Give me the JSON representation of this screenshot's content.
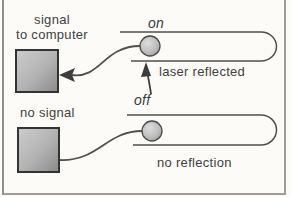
{
  "figure": {
    "top_panel": {
      "output_label_line1": "signal",
      "output_label_line2": "to computer",
      "state_label": "on",
      "annotation": "laser reflected"
    },
    "bottom_panel": {
      "output_label": "no signal",
      "state_label": "off",
      "annotation": "no reflection"
    },
    "colors": {
      "ink": "#4a4a4a",
      "text": "#414141",
      "box_fill_light": "#cccccc",
      "box_fill_dark": "#8a8a8a",
      "ball_fill_light": "#dddddd",
      "ball_fill_dark": "#969696",
      "frame": "#9a9a9a",
      "background": "#fcfbf8"
    }
  }
}
